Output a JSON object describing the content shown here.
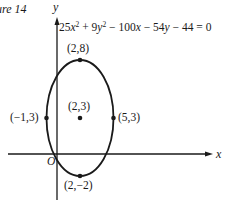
{
  "figure": {
    "caption": "ure 14",
    "equation": {
      "t1": "25",
      "v1": "x",
      "e1": "2",
      "t2": " + 9",
      "v2": "y",
      "e2": "2",
      "t3": " − 100",
      "v3": "x",
      "t4": " − 54",
      "v4": "y",
      "t5": " − 44 = 0"
    },
    "axes": {
      "x_label": "x",
      "y_label": "y",
      "origin_label": "O"
    },
    "points": [
      {
        "name": "top-vertex",
        "label": "(2,8)",
        "x": 2,
        "y": 8
      },
      {
        "name": "center",
        "label": "(2,3)",
        "x": 2,
        "y": 3
      },
      {
        "name": "left-co-vertex",
        "label": "(−1,3)",
        "x": -1,
        "y": 3
      },
      {
        "name": "right-co-vertex",
        "label": "(5,3)",
        "x": 5,
        "y": 3
      },
      {
        "name": "bottom-vertex",
        "label": "(2,−2)",
        "x": 2,
        "y": -2
      }
    ],
    "ellipse": {
      "center": [
        2,
        3
      ],
      "semi_major_vertical": 5,
      "semi_minor_horizontal": 3
    },
    "colors": {
      "stroke": "#1a1a1a",
      "background": "#ffffff"
    }
  }
}
